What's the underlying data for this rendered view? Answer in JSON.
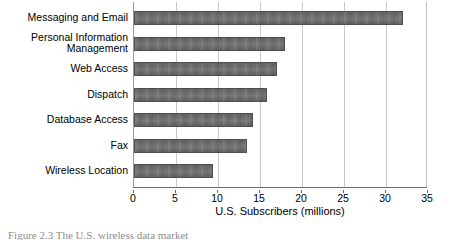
{
  "chart_data": {
    "type": "bar",
    "orientation": "horizontal",
    "title": "",
    "xlabel": "U.S. Subscribers (millions)",
    "ylabel": "",
    "xlim": [
      0,
      35
    ],
    "xticks": [
      0,
      5,
      10,
      15,
      20,
      25,
      30,
      35
    ],
    "xtick_labels": [
      "0",
      "5",
      "10",
      "15",
      "20",
      "25",
      "30",
      "35"
    ],
    "grid": "vertical",
    "legend": "none",
    "bar_color": "#6e6e6e",
    "bar_edge_color": "#4f4f4f",
    "gridline_color": "#c9c9c9",
    "categories": [
      "Messaging and Email",
      "Personal Information\nManagement",
      "Web Access",
      "Dispatch",
      "Database Access",
      "Fax",
      "Wireless Location"
    ],
    "values": [
      32,
      18,
      17,
      15.8,
      14.2,
      13.5,
      9.4
    ]
  },
  "caption": {
    "text": "Figure 2.3   The U.S. wireless data market"
  }
}
